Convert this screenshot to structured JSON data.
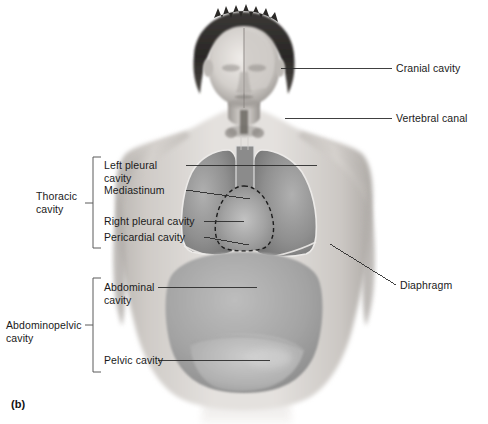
{
  "figure": {
    "panel_label": "(b)",
    "title_semantic": "body-cavities-anterior-view"
  },
  "labels": {
    "cranial_cavity": "Cranial cavity",
    "vertebral_canal": "Vertebral canal",
    "diaphragm": "Diaphragm",
    "left_pleural_line1": "Left pleural",
    "left_pleural_line2": "cavity",
    "mediastinum": "Mediastinum",
    "right_pleural_cavity": "Right pleural cavity",
    "pericardial_cavity": "Pericardial cavity",
    "thoracic_line1": "Thoracic",
    "thoracic_line2": "cavity",
    "abdominal_line1": "Abdominal",
    "abdominal_line2": "cavity",
    "pelvic_cavity": "Pelvic cavity",
    "abdominopelvic_line1": "Abdominopelvic",
    "abdominopelvic_line2": "cavity"
  },
  "colors": {
    "background": "#ffffff",
    "leader_line": "#2b2b2b",
    "text": "#1a1a1a",
    "bracket": "#5a5a5a",
    "skin_light": "#e6e3e0",
    "skin_mid": "#c8c4c0",
    "skin_dark": "#8e8a86",
    "cavity_gray": "#9b9b9b",
    "cavity_dark": "#707070",
    "hair_dark": "#2e2c2b",
    "outline_light": "#efefef"
  },
  "icons": {
    "bracket_thoracic": "square-bracket-icon",
    "bracket_abdominopelvic": "square-bracket-icon"
  }
}
